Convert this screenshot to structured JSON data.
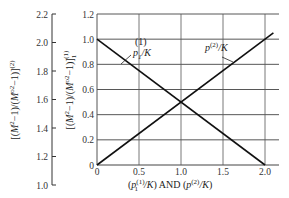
{
  "chart_data": {
    "type": "line",
    "title": "",
    "xlabel": "(p1(1)/K) AND (p(2)/K)",
    "xlabel_parts": {
      "left": "(p",
      "left_sup": "(1)",
      "left_sub": "1",
      "left_tail": "/K)",
      "and": "AND",
      "right": "(p",
      "right_sup": "(2)",
      "right_tail": "/K)"
    },
    "ylabel_main": "[(M2-1)/(M02-1)]1(1)",
    "ylabel_aux": "[(M2-1)/(M02-1)](2)",
    "xlim": [
      0,
      2.15
    ],
    "ylim": [
      0,
      1.2
    ],
    "aux_ylim": [
      1.0,
      2.2
    ],
    "x_ticks": [
      "0",
      "0.5",
      "1.0",
      "1.5",
      "2.0"
    ],
    "y_ticks": [
      "0",
      "0.2",
      "0.4",
      "0.6",
      "0.8",
      "1.0",
      "1.2"
    ],
    "aux_y_ticks": [
      "1.0",
      "1.2",
      "1.4",
      "1.6",
      "1.8",
      "2.0",
      "2.2"
    ],
    "grid": true,
    "series": [
      {
        "name": "p1(1)/K",
        "label": "p",
        "label_sup": "(1)",
        "label_sub": "1",
        "label_tail": "/K",
        "x": [
          0,
          2.0
        ],
        "y": [
          1.0,
          0.0
        ]
      },
      {
        "name": "p(2)/K",
        "label": "p",
        "label_sup": "(2)",
        "label_tail": "/K",
        "x": [
          0,
          2.1
        ],
        "y": [
          0.0,
          1.05
        ]
      }
    ],
    "intersection": {
      "x": 1.0,
      "y": 0.5
    }
  }
}
